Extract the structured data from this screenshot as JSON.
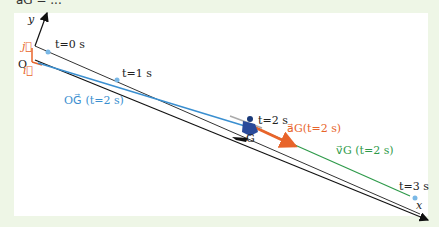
{
  "top_fragment": "a⃗G = ...",
  "axes": {
    "x": "x",
    "y": "y",
    "origin": "O",
    "i": "i⃗",
    "j": "j⃗"
  },
  "times": {
    "t0": "t=0 s",
    "t1": "t=1 s",
    "t2": "t=2 s",
    "t3": "t=3 s"
  },
  "point": "G",
  "vectors": {
    "OG": "OG⃗ (t=2 s)",
    "aG": "a⃗G(t=2 s)",
    "vG": "v⃗G (t=2 s)"
  },
  "colors": {
    "background": "#eef6e6",
    "og": "#3a8fd0",
    "accel": "#e8642a",
    "velocity": "#2e9a4a",
    "axis": "#222222"
  }
}
